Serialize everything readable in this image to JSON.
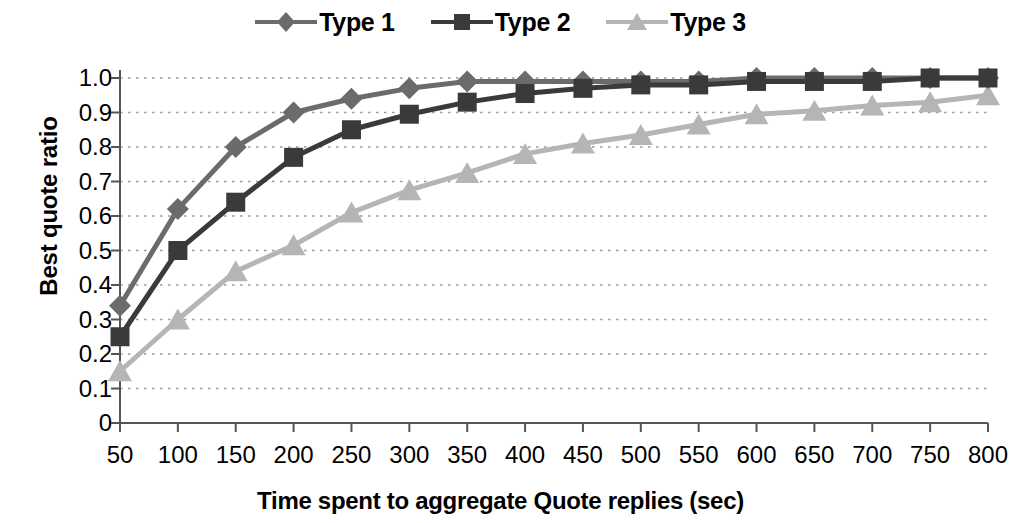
{
  "chart_data": {
    "type": "line",
    "title": "",
    "xlabel": "Time spent to aggregate Quote replies (sec)",
    "ylabel": "Best quote ratio",
    "grid": "horizontal-dotted",
    "legend_position": "top-center",
    "xlim": [
      50,
      800
    ],
    "ylim": [
      0,
      1.0
    ],
    "ytick_labels": [
      "1.0",
      "0.9",
      "0.8",
      "0.7",
      "0.6",
      "0.5",
      "0.4",
      "0.3",
      "0.2",
      "0.1",
      "0"
    ],
    "ytick_values": [
      1.0,
      0.9,
      0.8,
      0.7,
      0.6,
      0.5,
      0.4,
      0.3,
      0.2,
      0.1,
      0
    ],
    "categories": [
      50,
      100,
      150,
      200,
      250,
      300,
      350,
      400,
      450,
      500,
      550,
      600,
      650,
      700,
      750,
      800
    ],
    "xtick_labels": [
      "50",
      "100",
      "150",
      "200",
      "250",
      "300",
      "350",
      "400",
      "450",
      "500",
      "550",
      "600",
      "650",
      "700",
      "750",
      "800"
    ],
    "series": [
      {
        "name": "Type 1",
        "marker": "diamond",
        "color": "#6b6b6b",
        "values": [
          0.34,
          0.62,
          0.8,
          0.9,
          0.94,
          0.97,
          0.99,
          0.99,
          0.99,
          0.99,
          0.99,
          1.0,
          1.0,
          1.0,
          1.0,
          1.0
        ]
      },
      {
        "name": "Type 2",
        "marker": "square",
        "color": "#3a3a3a",
        "values": [
          0.25,
          0.5,
          0.64,
          0.77,
          0.85,
          0.895,
          0.93,
          0.955,
          0.97,
          0.98,
          0.98,
          0.99,
          0.99,
          0.99,
          1.0,
          1.0
        ]
      },
      {
        "name": "Type 3",
        "marker": "triangle",
        "color": "#b5b5b5",
        "values": [
          0.15,
          0.3,
          0.44,
          0.515,
          0.61,
          0.675,
          0.725,
          0.78,
          0.81,
          0.835,
          0.865,
          0.895,
          0.905,
          0.92,
          0.93,
          0.95
        ]
      }
    ]
  },
  "legend": {
    "entries": [
      {
        "label": "Type 1"
      },
      {
        "label": "Type 2"
      },
      {
        "label": "Type 3"
      }
    ]
  },
  "axes": {
    "y_title": "Best quote ratio",
    "x_title": "Time spent to aggregate Quote replies (sec)"
  },
  "colors": {
    "type1": "#6b6b6b",
    "type2": "#3a3a3a",
    "type3": "#b5b5b5",
    "axis": "#555555",
    "grid": "#9a9a9a",
    "background": "#ffffff"
  }
}
